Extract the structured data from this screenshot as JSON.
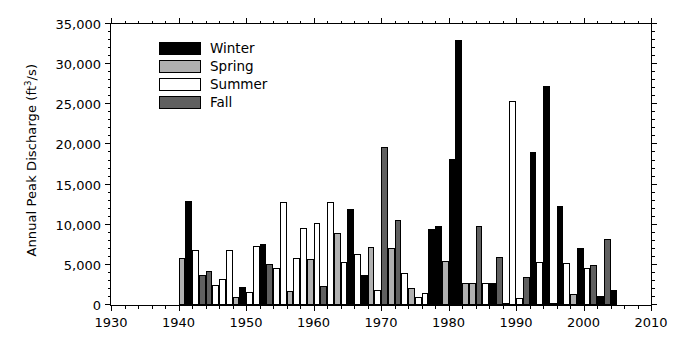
{
  "chart_data": {
    "type": "bar",
    "title": "",
    "subtitle": "",
    "xlabel": "",
    "ylabel": "Annual Peak Discharge (ft3/s)",
    "ylabel_parts": {
      "pre": "Annual Peak Discharge (ft",
      "sup": "3",
      "post": "/s)"
    },
    "xlim": [
      1930,
      2010
    ],
    "ylim": [
      0,
      35000
    ],
    "xticks": [
      1930,
      1940,
      1950,
      1960,
      1970,
      1980,
      1990,
      2000,
      2010
    ],
    "xticklabels": [
      "1930",
      "1940",
      "1950",
      "1960",
      "1970",
      "1980",
      "1990",
      "2000",
      "2010"
    ],
    "x_minor_interval": 2,
    "yticks": [
      0,
      5000,
      10000,
      15000,
      20000,
      25000,
      30000,
      35000
    ],
    "yticklabels": [
      "0",
      "5,000",
      "10,000",
      "15,000",
      "20,000",
      "25,000",
      "30,000",
      "35,000"
    ],
    "y_minor_interval": 1000,
    "grid": false,
    "legend_position": "upper-left-inside",
    "series_names": [
      "Winter",
      "Spring",
      "Summer",
      "Fall"
    ],
    "series_colors": [
      "#000000",
      "#b0b0b0",
      "#ffffff",
      "#606060"
    ],
    "bars": [
      {
        "year": 1940,
        "season": "Spring",
        "value": 5900
      },
      {
        "year": 1941,
        "season": "Winter",
        "value": 12900
      },
      {
        "year": 1942,
        "season": "Summer",
        "value": 6800
      },
      {
        "year": 1943,
        "season": "Fall",
        "value": 3800
      },
      {
        "year": 1944,
        "season": "Fall",
        "value": 4200
      },
      {
        "year": 1945,
        "season": "Summer",
        "value": 2500
      },
      {
        "year": 1946,
        "season": "Summer",
        "value": 3300
      },
      {
        "year": 1947,
        "season": "Summer",
        "value": 6800
      },
      {
        "year": 1948,
        "season": "Spring",
        "value": 1000
      },
      {
        "year": 1949,
        "season": "Winter",
        "value": 2300
      },
      {
        "year": 1950,
        "season": "Summer",
        "value": 1600
      },
      {
        "year": 1951,
        "season": "Summer",
        "value": 7300
      },
      {
        "year": 1952,
        "season": "Winter",
        "value": 7600
      },
      {
        "year": 1953,
        "season": "Fall",
        "value": 5100
      },
      {
        "year": 1954,
        "season": "Summer",
        "value": 4600
      },
      {
        "year": 1955,
        "season": "Summer",
        "value": 12800
      },
      {
        "year": 1956,
        "season": "Spring",
        "value": 1700
      },
      {
        "year": 1957,
        "season": "Summer",
        "value": 5900
      },
      {
        "year": 1958,
        "season": "Summer",
        "value": 9600
      },
      {
        "year": 1959,
        "season": "Spring",
        "value": 5700
      },
      {
        "year": 1960,
        "season": "Summer",
        "value": 10200
      },
      {
        "year": 1961,
        "season": "Fall",
        "value": 2400
      },
      {
        "year": 1962,
        "season": "Summer",
        "value": 12800
      },
      {
        "year": 1963,
        "season": "Spring",
        "value": 9000
      },
      {
        "year": 1964,
        "season": "Summer",
        "value": 5300
      },
      {
        "year": 1965,
        "season": "Winter",
        "value": 12000
      },
      {
        "year": 1966,
        "season": "Summer",
        "value": 6300
      },
      {
        "year": 1967,
        "season": "Winter",
        "value": 3800
      },
      {
        "year": 1968,
        "season": "Spring",
        "value": 7200
      },
      {
        "year": 1969,
        "season": "Summer",
        "value": 1900
      },
      {
        "year": 1970,
        "season": "Fall",
        "value": 19700
      },
      {
        "year": 1971,
        "season": "Spring",
        "value": 7100
      },
      {
        "year": 1972,
        "season": "Fall",
        "value": 10600
      },
      {
        "year": 1973,
        "season": "Summer",
        "value": 4000
      },
      {
        "year": 1974,
        "season": "Spring",
        "value": 2100
      },
      {
        "year": 1975,
        "season": "Summer",
        "value": 1000
      },
      {
        "year": 1976,
        "season": "Summer",
        "value": 1500
      },
      {
        "year": 1977,
        "season": "Winter",
        "value": 9500
      },
      {
        "year": 1978,
        "season": "Winter",
        "value": 9800
      },
      {
        "year": 1979,
        "season": "Spring",
        "value": 5500
      },
      {
        "year": 1980,
        "season": "Winter",
        "value": 18200
      },
      {
        "year": 1981,
        "season": "Winter",
        "value": 33000
      },
      {
        "year": 1982,
        "season": "Spring",
        "value": 2700
      },
      {
        "year": 1983,
        "season": "Spring",
        "value": 2700
      },
      {
        "year": 1984,
        "season": "Fall",
        "value": 9800
      },
      {
        "year": 1985,
        "season": "Summer",
        "value": 2800
      },
      {
        "year": 1986,
        "season": "Winter",
        "value": 2700
      },
      {
        "year": 1987,
        "season": "Fall",
        "value": 6000
      },
      {
        "year": 1988,
        "season": "Winter",
        "value": 300
      },
      {
        "year": 1989,
        "season": "Summer",
        "value": 25400
      },
      {
        "year": 1990,
        "season": "Summer",
        "value": 900
      },
      {
        "year": 1991,
        "season": "Fall",
        "value": 3500
      },
      {
        "year": 1992,
        "season": "Winter",
        "value": 19100
      },
      {
        "year": 1993,
        "season": "Summer",
        "value": 5300
      },
      {
        "year": 1994,
        "season": "Winter",
        "value": 27300
      },
      {
        "year": 1995,
        "season": "Winter",
        "value": 300
      },
      {
        "year": 1996,
        "season": "Winter",
        "value": 12300
      },
      {
        "year": 1997,
        "season": "Summer",
        "value": 5200
      },
      {
        "year": 1998,
        "season": "Spring",
        "value": 1400
      },
      {
        "year": 1999,
        "season": "Winter",
        "value": 7100
      },
      {
        "year": 2000,
        "season": "Summer",
        "value": 4600
      },
      {
        "year": 2001,
        "season": "Fall",
        "value": 5000
      },
      {
        "year": 2002,
        "season": "Winter",
        "value": 1100
      },
      {
        "year": 2003,
        "season": "Fall",
        "value": 8200
      },
      {
        "year": 2004,
        "season": "Winter",
        "value": 1900
      }
    ]
  },
  "legend": {
    "items": [
      {
        "label": "Winter",
        "color": "#000000"
      },
      {
        "label": "Spring",
        "color": "#b0b0b0"
      },
      {
        "label": "Summer",
        "color": "#ffffff"
      },
      {
        "label": "Fall",
        "color": "#606060"
      }
    ]
  }
}
